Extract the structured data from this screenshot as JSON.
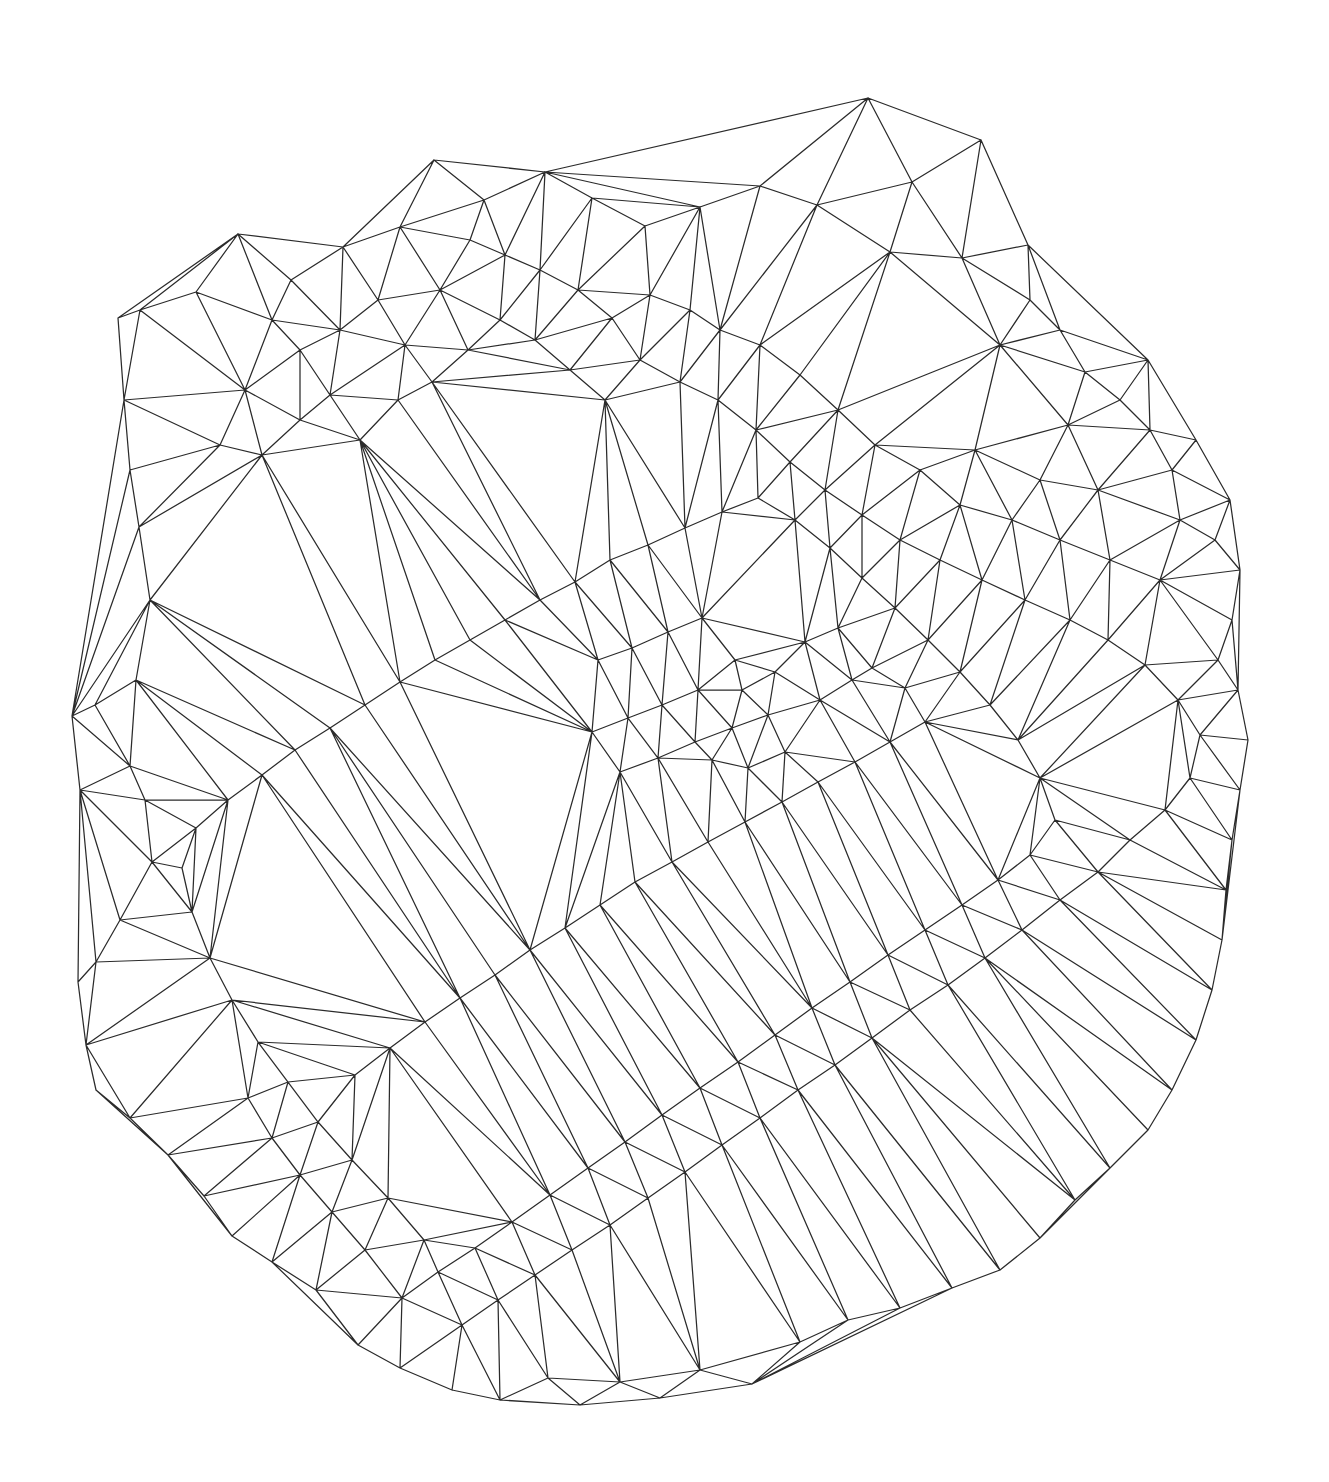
{
  "figure": {
    "name": "delaunay-triangulation-mesh",
    "kind": "triangulated-mesh",
    "background_color": "#ffffff",
    "stroke_color": "#2b2b2b",
    "stroke_width": 1.25,
    "canvas_width": 1329,
    "canvas_height": 1482,
    "title": "",
    "subtitle": "",
    "caption": "",
    "has_labels": false,
    "has_axes": false,
    "has_legend": false,
    "has_fill": false,
    "vertex_markers": false
  },
  "chart_data": {
    "type": "scatter",
    "title": "",
    "xlabel": "",
    "ylabel": "",
    "grid": false,
    "legend": "none",
    "xlim": [
      60,
      1270
    ],
    "ylim": [
      95,
      1400
    ],
    "render_mode": "delaunay-triangulation-edges",
    "point_count": 252,
    "points": [
      [
        868,
        98
      ],
      [
        912,
        182
      ],
      [
        981,
        140
      ],
      [
        1028,
        245
      ],
      [
        962,
        258
      ],
      [
        890,
        252
      ],
      [
        817,
        205
      ],
      [
        760,
        186
      ],
      [
        700,
        207
      ],
      [
        645,
        226
      ],
      [
        592,
        198
      ],
      [
        545,
        172
      ],
      [
        484,
        200
      ],
      [
        434,
        160
      ],
      [
        400,
        227
      ],
      [
        343,
        247
      ],
      [
        291,
        280
      ],
      [
        238,
        234
      ],
      [
        196,
        292
      ],
      [
        140,
        310
      ],
      [
        118,
        318
      ],
      [
        124,
        400
      ],
      [
        130,
        470
      ],
      [
        139,
        527
      ],
      [
        150,
        600
      ],
      [
        136,
        680
      ],
      [
        95,
        705
      ],
      [
        72,
        716
      ],
      [
        80,
        790
      ],
      [
        130,
        766
      ],
      [
        145,
        800
      ],
      [
        152,
        862
      ],
      [
        120,
        920
      ],
      [
        96,
        962
      ],
      [
        78,
        982
      ],
      [
        86,
        1045
      ],
      [
        96,
        1090
      ],
      [
        130,
        1118
      ],
      [
        168,
        1155
      ],
      [
        204,
        1196
      ],
      [
        232,
        1236
      ],
      [
        272,
        1262
      ],
      [
        316,
        1290
      ],
      [
        358,
        1345
      ],
      [
        400,
        1368
      ],
      [
        452,
        1390
      ],
      [
        500,
        1400
      ],
      [
        548,
        1378
      ],
      [
        580,
        1405
      ],
      [
        620,
        1382
      ],
      [
        660,
        1398
      ],
      [
        700,
        1370
      ],
      [
        752,
        1384
      ],
      [
        800,
        1342
      ],
      [
        848,
        1320
      ],
      [
        900,
        1308
      ],
      [
        952,
        1288
      ],
      [
        1000,
        1270
      ],
      [
        1040,
        1238
      ],
      [
        1075,
        1200
      ],
      [
        1110,
        1168
      ],
      [
        1148,
        1130
      ],
      [
        1172,
        1090
      ],
      [
        1196,
        1040
      ],
      [
        1212,
        990
      ],
      [
        1222,
        940
      ],
      [
        1226,
        890
      ],
      [
        1232,
        840
      ],
      [
        1240,
        790
      ],
      [
        1248,
        740
      ],
      [
        1238,
        690
      ],
      [
        1218,
        660
      ],
      [
        1232,
        620
      ],
      [
        1240,
        570
      ],
      [
        1215,
        540
      ],
      [
        1180,
        520
      ],
      [
        1172,
        470
      ],
      [
        1150,
        430
      ],
      [
        1120,
        400
      ],
      [
        1085,
        372
      ],
      [
        1060,
        330
      ],
      [
        1030,
        300
      ],
      [
        1148,
        360
      ],
      [
        1196,
        440
      ],
      [
        1230,
        500
      ],
      [
        1068,
        425
      ],
      [
        1000,
        345
      ],
      [
        975,
        450
      ],
      [
        1040,
        480
      ],
      [
        1098,
        490
      ],
      [
        1160,
        580
      ],
      [
        1110,
        560
      ],
      [
        1060,
        540
      ],
      [
        1012,
        520
      ],
      [
        960,
        505
      ],
      [
        920,
        470
      ],
      [
        875,
        445
      ],
      [
        838,
        410
      ],
      [
        800,
        375
      ],
      [
        760,
        345
      ],
      [
        720,
        330
      ],
      [
        690,
        310
      ],
      [
        650,
        295
      ],
      [
        612,
        318
      ],
      [
        578,
        290
      ],
      [
        540,
        270
      ],
      [
        505,
        255
      ],
      [
        470,
        240
      ],
      [
        440,
        290
      ],
      [
        405,
        345
      ],
      [
        378,
        300
      ],
      [
        340,
        330
      ],
      [
        300,
        350
      ],
      [
        272,
        320
      ],
      [
        245,
        390
      ],
      [
        220,
        445
      ],
      [
        262,
        455
      ],
      [
        300,
        420
      ],
      [
        330,
        395
      ],
      [
        360,
        440
      ],
      [
        398,
        400
      ],
      [
        432,
        382
      ],
      [
        468,
        350
      ],
      [
        500,
        320
      ],
      [
        535,
        340
      ],
      [
        570,
        370
      ],
      [
        605,
        400
      ],
      [
        640,
        360
      ],
      [
        680,
        382
      ],
      [
        718,
        400
      ],
      [
        756,
        430
      ],
      [
        790,
        462
      ],
      [
        825,
        490
      ],
      [
        862,
        515
      ],
      [
        900,
        540
      ],
      [
        940,
        560
      ],
      [
        982,
        580
      ],
      [
        1025,
        600
      ],
      [
        1070,
        620
      ],
      [
        1108,
        640
      ],
      [
        1145,
        665
      ],
      [
        1178,
        700
      ],
      [
        1200,
        735
      ],
      [
        1190,
        778
      ],
      [
        1165,
        810
      ],
      [
        1130,
        840
      ],
      [
        1098,
        872
      ],
      [
        1060,
        900
      ],
      [
        1022,
        930
      ],
      [
        985,
        958
      ],
      [
        948,
        985
      ],
      [
        910,
        1010
      ],
      [
        872,
        1038
      ],
      [
        835,
        1065
      ],
      [
        798,
        1090
      ],
      [
        760,
        1118
      ],
      [
        722,
        1145
      ],
      [
        685,
        1172
      ],
      [
        648,
        1198
      ],
      [
        610,
        1225
      ],
      [
        572,
        1250
      ],
      [
        535,
        1275
      ],
      [
        498,
        1300
      ],
      [
        462,
        1325
      ],
      [
        424,
        1240
      ],
      [
        388,
        1198
      ],
      [
        352,
        1160
      ],
      [
        318,
        1122
      ],
      [
        288,
        1082
      ],
      [
        258,
        1042
      ],
      [
        232,
        1000
      ],
      [
        210,
        958
      ],
      [
        192,
        912
      ],
      [
        182,
        868
      ],
      [
        196,
        828
      ],
      [
        228,
        800
      ],
      [
        262,
        775
      ],
      [
        295,
        750
      ],
      [
        330,
        728
      ],
      [
        365,
        705
      ],
      [
        400,
        682
      ],
      [
        435,
        660
      ],
      [
        470,
        640
      ],
      [
        505,
        620
      ],
      [
        540,
        600
      ],
      [
        575,
        582
      ],
      [
        610,
        560
      ],
      [
        648,
        545
      ],
      [
        685,
        528
      ],
      [
        722,
        512
      ],
      [
        758,
        498
      ],
      [
        795,
        520
      ],
      [
        830,
        548
      ],
      [
        862,
        578
      ],
      [
        895,
        608
      ],
      [
        928,
        640
      ],
      [
        960,
        672
      ],
      [
        990,
        705
      ],
      [
        1018,
        740
      ],
      [
        1040,
        778
      ],
      [
        1055,
        820
      ],
      [
        1030,
        855
      ],
      [
        998,
        880
      ],
      [
        962,
        905
      ],
      [
        925,
        930
      ],
      [
        888,
        955
      ],
      [
        850,
        982
      ],
      [
        812,
        1008
      ],
      [
        775,
        1035
      ],
      [
        738,
        1062
      ],
      [
        700,
        1088
      ],
      [
        662,
        1115
      ],
      [
        625,
        1142
      ],
      [
        588,
        1168
      ],
      [
        550,
        1195
      ],
      [
        512,
        1222
      ],
      [
        475,
        1248
      ],
      [
        438,
        1272
      ],
      [
        402,
        1298
      ],
      [
        365,
        1250
      ],
      [
        332,
        1212
      ],
      [
        300,
        1175
      ],
      [
        272,
        1138
      ],
      [
        248,
        1098
      ],
      [
        355,
        1075
      ],
      [
        390,
        1048
      ],
      [
        425,
        1022
      ],
      [
        460,
        998
      ],
      [
        495,
        975
      ],
      [
        530,
        950
      ],
      [
        565,
        928
      ],
      [
        600,
        905
      ],
      [
        635,
        882
      ],
      [
        672,
        862
      ],
      [
        708,
        842
      ],
      [
        745,
        822
      ],
      [
        782,
        802
      ],
      [
        818,
        782
      ],
      [
        855,
        762
      ],
      [
        890,
        742
      ],
      [
        925,
        722
      ],
      [
        598,
        660
      ],
      [
        632,
        648
      ],
      [
        668,
        632
      ],
      [
        702,
        618
      ],
      [
        735,
        660
      ],
      [
        698,
        690
      ],
      [
        662,
        705
      ],
      [
        628,
        718
      ],
      [
        592,
        732
      ],
      [
        620,
        772
      ],
      [
        658,
        758
      ],
      [
        695,
        742
      ],
      [
        732,
        728
      ],
      [
        768,
        715
      ],
      [
        775,
        672
      ],
      [
        742,
        690
      ],
      [
        712,
        760
      ],
      [
        748,
        768
      ],
      [
        785,
        752
      ],
      [
        820,
        700
      ],
      [
        852,
        680
      ],
      [
        805,
        642
      ],
      [
        838,
        628
      ],
      [
        872,
        668
      ],
      [
        905,
        688
      ]
    ]
  }
}
